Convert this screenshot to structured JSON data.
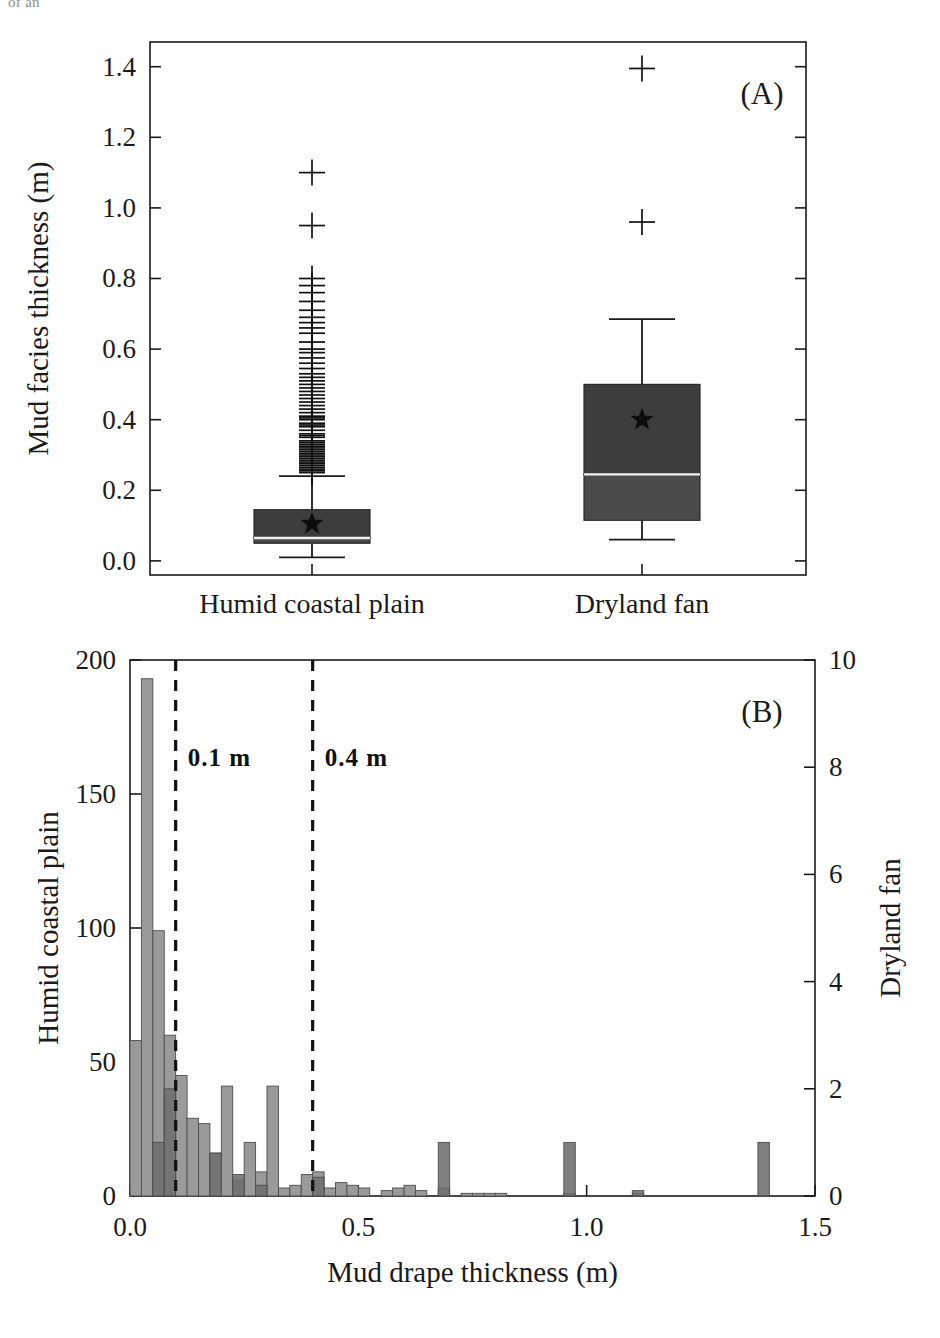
{
  "figure": {
    "clipped_header_text": "of an",
    "width": 940,
    "height": 1338
  },
  "colors": {
    "bar_light": "#9a9a9a",
    "bar_dark": "#6e6e6e",
    "box_dark": "#3d3d3d",
    "box_mid": "#4a4a4a",
    "axis": "#1a1a1a",
    "median": "#f2f2f2",
    "dash": "#111111"
  },
  "panel_a": {
    "label": "(A)",
    "ylabel": "Mud facies thickness (m)",
    "ylim": [
      -0.04,
      1.47
    ],
    "yticks": [
      0.0,
      0.2,
      0.4,
      0.6,
      0.8,
      1.0,
      1.2,
      1.4
    ],
    "ytick_labels": [
      "0.0",
      "0.2",
      "0.4",
      "0.6",
      "0.8",
      "1.0",
      "1.2",
      "1.4"
    ],
    "categories": [
      "Humid coastal plain",
      "Dryland fan"
    ]
  },
  "panel_b": {
    "label": "(B)",
    "xlabel": "Mud drape thickness (m)",
    "ylabel_left": "Humid coastal plain",
    "ylabel_right": "Dryland fan",
    "xlim": [
      0.0,
      1.5
    ],
    "xticks": [
      0.0,
      0.5,
      1.0,
      1.5
    ],
    "xtick_labels": [
      "0.0",
      "0.5",
      "1.0",
      "1.5"
    ],
    "ylim_left": [
      0,
      200
    ],
    "yticks_left": [
      0,
      50,
      100,
      150,
      200
    ],
    "ytick_labels_left": [
      "0",
      "50",
      "100",
      "150",
      "200"
    ],
    "ylim_right": [
      0,
      10
    ],
    "yticks_right": [
      0,
      2,
      4,
      6,
      8,
      10
    ],
    "ytick_labels_right": [
      "0",
      "2",
      "4",
      "6",
      "8",
      "10"
    ],
    "threshold_labels": [
      "0.1 m",
      "0.4 m"
    ],
    "threshold_values": [
      0.1,
      0.4
    ]
  },
  "chart_data": [
    {
      "type": "box",
      "title": "Mud facies thickness by depositional setting",
      "panel": "(A)",
      "xlabel": "",
      "ylabel": "Mud facies thickness (m)",
      "ylim": [
        -0.04,
        1.47
      ],
      "yticks": [
        0.0,
        0.2,
        0.4,
        0.6,
        0.8,
        1.0,
        1.2,
        1.4
      ],
      "grid": false,
      "legend": "none",
      "categories": [
        "Humid coastal plain",
        "Dryland fan"
      ],
      "boxes": [
        {
          "name": "Humid coastal plain",
          "whisker_low": 0.01,
          "q1": 0.05,
          "median": 0.065,
          "q3": 0.145,
          "whisker_high": 0.24,
          "mean": 0.105,
          "mean_marker": "star",
          "outlier_marker": "plus",
          "outliers": [
            0.25,
            0.255,
            0.26,
            0.265,
            0.27,
            0.275,
            0.28,
            0.285,
            0.29,
            0.295,
            0.3,
            0.305,
            0.31,
            0.315,
            0.32,
            0.325,
            0.33,
            0.335,
            0.34,
            0.35,
            0.355,
            0.36,
            0.37,
            0.38,
            0.385,
            0.39,
            0.4,
            0.405,
            0.41,
            0.42,
            0.43,
            0.44,
            0.45,
            0.46,
            0.47,
            0.48,
            0.49,
            0.5,
            0.51,
            0.52,
            0.53,
            0.545,
            0.56,
            0.575,
            0.59,
            0.6,
            0.62,
            0.645,
            0.66,
            0.675,
            0.69,
            0.71,
            0.735,
            0.76,
            0.78,
            0.8,
            0.95,
            1.1
          ]
        },
        {
          "name": "Dryland fan",
          "whisker_low": 0.06,
          "q1": 0.115,
          "median": 0.245,
          "q3": 0.5,
          "whisker_high": 0.685,
          "mean": 0.4,
          "mean_marker": "star",
          "outlier_marker": "plus",
          "outliers": [
            0.96,
            1.395
          ]
        }
      ]
    },
    {
      "type": "bar",
      "title": "Mud drape thickness distribution",
      "panel": "(B)",
      "xlabel": "Mud drape thickness (m)",
      "ylabel": "Humid coastal plain",
      "ylabel_secondary": "Dryland fan",
      "xlim": [
        0.0,
        1.5
      ],
      "ylim": [
        0,
        200
      ],
      "ylim_secondary": [
        0,
        10
      ],
      "grid": false,
      "legend": "none",
      "bin_width": 0.025,
      "annotations": [
        {
          "type": "vline",
          "x": 0.1,
          "label": "0.1 m",
          "style": "dashed"
        },
        {
          "type": "vline",
          "x": 0.4,
          "label": "0.4 m",
          "style": "dashed"
        }
      ],
      "series": [
        {
          "name": "Humid coastal plain",
          "axis": "left",
          "color": "#9a9a9a",
          "bins": [
            {
              "x": 0.0,
              "value": 58
            },
            {
              "x": 0.025,
              "value": 193
            },
            {
              "x": 0.05,
              "value": 99
            },
            {
              "x": 0.075,
              "value": 60
            },
            {
              "x": 0.1,
              "value": 45
            },
            {
              "x": 0.125,
              "value": 29
            },
            {
              "x": 0.15,
              "value": 27
            },
            {
              "x": 0.175,
              "value": 16
            },
            {
              "x": 0.2,
              "value": 41
            },
            {
              "x": 0.225,
              "value": 6
            },
            {
              "x": 0.25,
              "value": 20
            },
            {
              "x": 0.275,
              "value": 9
            },
            {
              "x": 0.3,
              "value": 41
            },
            {
              "x": 0.325,
              "value": 3
            },
            {
              "x": 0.35,
              "value": 4
            },
            {
              "x": 0.375,
              "value": 8
            },
            {
              "x": 0.4,
              "value": 9
            },
            {
              "x": 0.425,
              "value": 3
            },
            {
              "x": 0.45,
              "value": 5
            },
            {
              "x": 0.475,
              "value": 4
            },
            {
              "x": 0.5,
              "value": 3
            },
            {
              "x": 0.55,
              "value": 2
            },
            {
              "x": 0.575,
              "value": 3
            },
            {
              "x": 0.6,
              "value": 4
            },
            {
              "x": 0.625,
              "value": 2
            },
            {
              "x": 0.675,
              "value": 3
            },
            {
              "x": 0.725,
              "value": 1
            },
            {
              "x": 0.75,
              "value": 1
            },
            {
              "x": 0.775,
              "value": 1
            },
            {
              "x": 0.8,
              "value": 1
            },
            {
              "x": 0.95,
              "value": 1
            },
            {
              "x": 1.1,
              "value": 1
            }
          ]
        },
        {
          "name": "Dryland fan",
          "axis": "right",
          "color": "#6e6e6e",
          "bins": [
            {
              "x": 0.05,
              "value": 1
            },
            {
              "x": 0.075,
              "value": 2
            },
            {
              "x": 0.175,
              "value": 0.8
            },
            {
              "x": 0.225,
              "value": 0.4
            },
            {
              "x": 0.275,
              "value": 0.2
            },
            {
              "x": 0.4,
              "value": 0.35
            },
            {
              "x": 0.675,
              "value": 1
            },
            {
              "x": 0.95,
              "value": 1
            },
            {
              "x": 1.1,
              "value": 0.1
            },
            {
              "x": 1.375,
              "value": 1
            }
          ]
        }
      ]
    }
  ]
}
